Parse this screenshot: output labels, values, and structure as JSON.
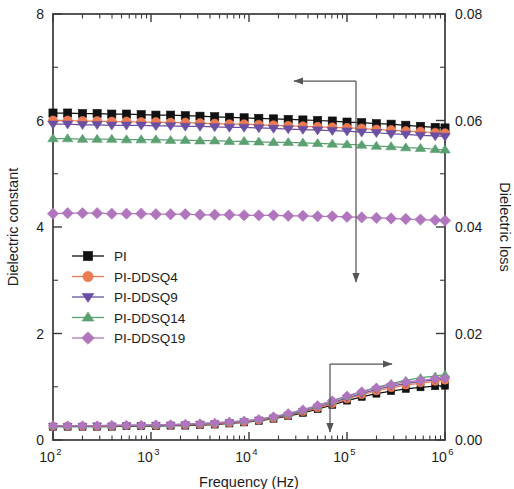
{
  "chart_data": {
    "type": "line",
    "title": "",
    "xlabel": "Frequency (Hz)",
    "ylabel": "Dielectric constant",
    "y2label": "Dielectric loss",
    "xscale": "log",
    "xlim": [
      100,
      1000000
    ],
    "ylim": [
      0,
      8
    ],
    "y2lim": [
      0.0,
      0.08
    ],
    "grid": false,
    "legend_position": "center-left",
    "xticks": [
      "10^2",
      "10^3",
      "10^4",
      "10^5",
      "10^6"
    ],
    "xtick_base": [
      "10",
      "10",
      "10",
      "10",
      "10"
    ],
    "xtick_exp": [
      "2",
      "3",
      "4",
      "5",
      "6"
    ],
    "yticks": [
      "0",
      "2",
      "4",
      "6",
      "8"
    ],
    "ytick_values": [
      0,
      2,
      4,
      6,
      8
    ],
    "y2ticks": [
      "0.00",
      "0.02",
      "0.04",
      "0.06",
      "0.08"
    ],
    "y2tick_values": [
      0.0,
      0.02,
      0.04,
      0.06,
      0.08
    ],
    "annotations": [
      {
        "name": "left-axis-arrow",
        "text": "",
        "direction": "left-down"
      },
      {
        "name": "right-axis-arrow",
        "text": "",
        "direction": "right-down"
      }
    ],
    "x": [
      100,
      141,
      200,
      282,
      398,
      562,
      794,
      1122,
      1585,
      2239,
      3162,
      4467,
      6310,
      8913,
      12589,
      17783,
      25119,
      35481,
      50119,
      70795,
      100000,
      141254,
      199526,
      281838,
      398107,
      562341,
      794328,
      1000000
    ],
    "series": [
      {
        "name": "PI",
        "color": "#111111",
        "marker": "square",
        "axis": "left",
        "values": [
          6.14,
          6.14,
          6.13,
          6.13,
          6.12,
          6.12,
          6.11,
          6.1,
          6.1,
          6.09,
          6.08,
          6.07,
          6.06,
          6.05,
          6.04,
          6.03,
          6.02,
          6.01,
          6.0,
          5.99,
          5.97,
          5.96,
          5.94,
          5.93,
          5.91,
          5.89,
          5.87,
          5.86
        ]
      },
      {
        "name": "PI-DDSQ4",
        "color": "#ec7a52",
        "marker": "circle",
        "axis": "left",
        "values": [
          6.0,
          6.0,
          5.99,
          5.99,
          5.98,
          5.98,
          5.97,
          5.97,
          5.96,
          5.96,
          5.95,
          5.94,
          5.93,
          5.93,
          5.92,
          5.91,
          5.9,
          5.89,
          5.88,
          5.87,
          5.86,
          5.85,
          5.83,
          5.82,
          5.8,
          5.79,
          5.77,
          5.76
        ]
      },
      {
        "name": "PI-DDSQ9",
        "color": "#6a4fa3",
        "marker": "triangle-down",
        "axis": "left",
        "values": [
          5.93,
          5.93,
          5.92,
          5.92,
          5.91,
          5.91,
          5.91,
          5.9,
          5.9,
          5.89,
          5.89,
          5.88,
          5.87,
          5.87,
          5.86,
          5.85,
          5.84,
          5.83,
          5.82,
          5.81,
          5.8,
          5.78,
          5.77,
          5.75,
          5.74,
          5.72,
          5.71,
          5.7
        ]
      },
      {
        "name": "PI-DDSQ14",
        "color": "#5aa070",
        "marker": "triangle-up",
        "axis": "left",
        "values": [
          5.66,
          5.66,
          5.65,
          5.65,
          5.65,
          5.64,
          5.64,
          5.64,
          5.63,
          5.63,
          5.62,
          5.62,
          5.61,
          5.61,
          5.6,
          5.59,
          5.59,
          5.58,
          5.57,
          5.56,
          5.55,
          5.54,
          5.52,
          5.51,
          5.49,
          5.48,
          5.46,
          5.45
        ]
      },
      {
        "name": "PI-DDSQ19",
        "color": "#b075bd",
        "marker": "diamond",
        "axis": "left",
        "values": [
          4.25,
          4.26,
          4.26,
          4.26,
          4.25,
          4.25,
          4.25,
          4.24,
          4.24,
          4.24,
          4.23,
          4.23,
          4.23,
          4.22,
          4.22,
          4.22,
          4.21,
          4.21,
          4.2,
          4.2,
          4.19,
          4.18,
          4.17,
          4.16,
          4.15,
          4.14,
          4.13,
          4.12
        ]
      },
      {
        "name": "PI",
        "color": "#111111",
        "marker": "square",
        "axis": "right",
        "values": [
          0.0025,
          0.0025,
          0.0025,
          0.0025,
          0.0025,
          0.0026,
          0.0026,
          0.0026,
          0.0027,
          0.0027,
          0.0028,
          0.0029,
          0.0031,
          0.0033,
          0.0036,
          0.004,
          0.0045,
          0.0051,
          0.0058,
          0.0066,
          0.0074,
          0.0081,
          0.0087,
          0.0092,
          0.0096,
          0.0099,
          0.0101,
          0.0102
        ]
      },
      {
        "name": "PI-DDSQ4",
        "color": "#ec7a52",
        "marker": "circle",
        "axis": "right",
        "values": [
          0.0026,
          0.0026,
          0.0026,
          0.0026,
          0.0026,
          0.0027,
          0.0027,
          0.0027,
          0.0028,
          0.0028,
          0.0029,
          0.003,
          0.0032,
          0.0034,
          0.0037,
          0.0041,
          0.0046,
          0.0053,
          0.006,
          0.0068,
          0.0077,
          0.0085,
          0.0092,
          0.0098,
          0.0103,
          0.0107,
          0.011,
          0.0112
        ]
      },
      {
        "name": "PI-DDSQ9",
        "color": "#6a4fa3",
        "marker": "triangle-down",
        "axis": "right",
        "values": [
          0.0026,
          0.0026,
          0.0026,
          0.0027,
          0.0027,
          0.0027,
          0.0027,
          0.0028,
          0.0028,
          0.0029,
          0.003,
          0.0031,
          0.0033,
          0.0035,
          0.0038,
          0.0042,
          0.0047,
          0.0054,
          0.0062,
          0.007,
          0.0079,
          0.0087,
          0.0095,
          0.0101,
          0.0106,
          0.011,
          0.0113,
          0.0115
        ]
      },
      {
        "name": "PI-DDSQ14",
        "color": "#5aa070",
        "marker": "triangle-up",
        "axis": "right",
        "values": [
          0.0027,
          0.0027,
          0.0027,
          0.0027,
          0.0027,
          0.0028,
          0.0028,
          0.0028,
          0.0029,
          0.003,
          0.0031,
          0.0032,
          0.0034,
          0.0036,
          0.0039,
          0.0043,
          0.0049,
          0.0056,
          0.0064,
          0.0073,
          0.0082,
          0.0091,
          0.0099,
          0.0106,
          0.0112,
          0.0117,
          0.012,
          0.0123
        ]
      },
      {
        "name": "PI-DDSQ19",
        "color": "#b075bd",
        "marker": "diamond",
        "axis": "right",
        "values": [
          0.0027,
          0.0027,
          0.0027,
          0.0027,
          0.0028,
          0.0028,
          0.0028,
          0.0029,
          0.0029,
          0.003,
          0.0031,
          0.0032,
          0.0034,
          0.0036,
          0.0039,
          0.0044,
          0.005,
          0.0057,
          0.0065,
          0.0074,
          0.0083,
          0.0091,
          0.0098,
          0.0104,
          0.0109,
          0.0112,
          0.0115,
          0.0116
        ]
      }
    ],
    "legend": [
      {
        "label": "PI",
        "color": "#111111",
        "marker": "square"
      },
      {
        "label": "PI-DDSQ4",
        "color": "#ec7a52",
        "marker": "circle"
      },
      {
        "label": "PI-DDSQ9",
        "color": "#6a4fa3",
        "marker": "triangle-down"
      },
      {
        "label": "PI-DDSQ14",
        "color": "#5aa070",
        "marker": "triangle-up"
      },
      {
        "label": "PI-DDSQ19",
        "color": "#b075bd",
        "marker": "diamond"
      }
    ]
  }
}
